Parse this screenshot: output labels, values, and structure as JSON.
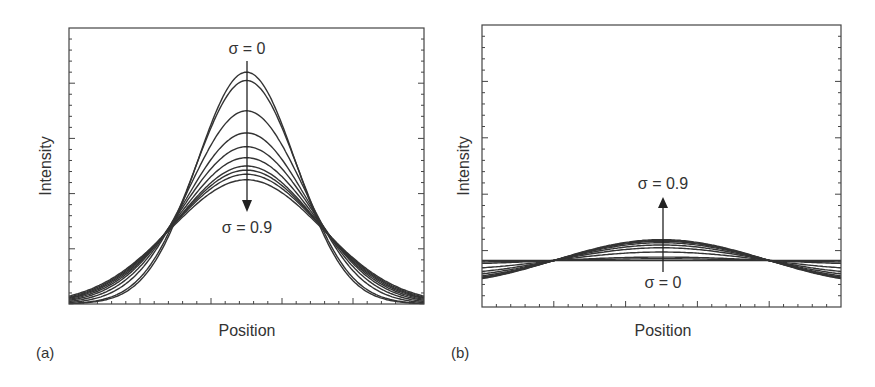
{
  "figure": {
    "panels": [
      {
        "id": "a",
        "label": "(a)",
        "xlabel": "Position",
        "ylabel": "Intensity",
        "annotation_top": "σ = 0",
        "annotation_bottom": "σ = 0.9",
        "arrow_direction": "down"
      },
      {
        "id": "b",
        "label": "(b)",
        "xlabel": "Position",
        "ylabel": "Intensity",
        "annotation_top": "σ = 0.9",
        "annotation_bottom": "σ = 0",
        "arrow_direction": "up"
      }
    ]
  },
  "chart_data": [
    {
      "type": "line",
      "title": "(a)",
      "xlabel": "Position",
      "ylabel": "Intensity",
      "grid": false,
      "legend": "none",
      "annotations": [
        "σ = 0",
        "σ = 0.9",
        "arrow from σ=0 down to σ=0.9"
      ],
      "x_range": [
        0,
        1
      ],
      "y_range": [
        0,
        1
      ],
      "note": "Family of bell-shaped profiles; peak height decreases and width increases as σ goes from 0 to 0.9. Curves cross near x≈0.28 and x≈0.72.",
      "series": [
        {
          "name": "σ=0",
          "peak": 0.84,
          "width": 0.14
        },
        {
          "name": "σ=0.1",
          "peak": 0.81,
          "width": 0.145
        },
        {
          "name": "σ=0.2",
          "peak": 0.7,
          "width": 0.16
        },
        {
          "name": "σ=0.3",
          "peak": 0.62,
          "width": 0.172
        },
        {
          "name": "σ=0.4",
          "peak": 0.57,
          "width": 0.182
        },
        {
          "name": "σ=0.5",
          "peak": 0.53,
          "width": 0.19
        },
        {
          "name": "σ=0.6",
          "peak": 0.5,
          "width": 0.197
        },
        {
          "name": "σ=0.7",
          "peak": 0.485,
          "width": 0.202
        },
        {
          "name": "σ=0.8",
          "peak": 0.47,
          "width": 0.207
        },
        {
          "name": "σ=0.9",
          "peak": 0.45,
          "width": 0.213
        }
      ]
    },
    {
      "type": "line",
      "title": "(b)",
      "xlabel": "Position",
      "ylabel": "Intensity",
      "grid": false,
      "legend": "none",
      "annotations": [
        "σ = 0.9",
        "σ = 0",
        "arrow from σ=0 up to σ=0.9"
      ],
      "x_range": [
        0,
        1
      ],
      "y_range": [
        0,
        1
      ],
      "note": "Cosine-like modulation about a baseline ≈0.165; amplitude grows from 0 (flat line at σ=0) to max at σ=0.9. Curves cross near x≈0.20 and x≈0.80.",
      "baseline": 0.165,
      "series": [
        {
          "name": "σ=0",
          "amplitude": 0.0
        },
        {
          "name": "σ=0.1",
          "amplitude": 0.006
        },
        {
          "name": "σ=0.2",
          "amplitude": 0.012
        },
        {
          "name": "σ=0.3",
          "amplitude": 0.03
        },
        {
          "name": "σ=0.4",
          "amplitude": 0.045
        },
        {
          "name": "σ=0.5",
          "amplitude": 0.055
        },
        {
          "name": "σ=0.6",
          "amplitude": 0.063
        },
        {
          "name": "σ=0.7",
          "amplitude": 0.068
        },
        {
          "name": "σ=0.8",
          "amplitude": 0.071
        },
        {
          "name": "σ=0.9",
          "amplitude": 0.074
        }
      ]
    }
  ]
}
